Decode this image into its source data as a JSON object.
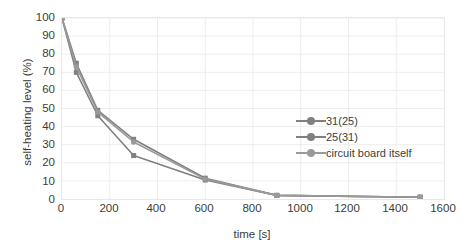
{
  "chart_data": {
    "type": "line",
    "title": "",
    "xlabel": "time [s]",
    "ylabel": "self-heating level (%)",
    "xlim": [
      0,
      1600
    ],
    "ylim": [
      0,
      100
    ],
    "xticks": [
      0,
      200,
      400,
      600,
      800,
      1000,
      1200,
      1400,
      1600
    ],
    "yticks": [
      0,
      10,
      20,
      30,
      40,
      50,
      60,
      70,
      80,
      90,
      100
    ],
    "grid": true,
    "legend_position": "inside-right",
    "series": [
      {
        "name": "31(25)",
        "color": "#808080",
        "x": [
          0,
          60,
          150,
          300,
          600,
          900,
          1500
        ],
        "y": [
          100,
          75,
          49,
          33,
          11.5,
          2,
          1
        ]
      },
      {
        "name": "25(31)",
        "color": "#808080",
        "x": [
          0,
          60,
          150,
          300,
          600,
          900,
          1500
        ],
        "y": [
          100,
          70,
          46,
          24,
          10.5,
          2,
          1
        ]
      },
      {
        "name": "circuit board itself",
        "color": "#9a9a9a",
        "x": [
          0,
          60,
          150,
          300,
          600,
          900,
          1500
        ],
        "y": [
          100,
          73,
          48,
          31.5,
          11,
          2,
          1
        ]
      }
    ]
  },
  "axes": {
    "y_tick_labels": [
      "100",
      "90",
      "80",
      "70",
      "60",
      "50",
      "40",
      "30",
      "20",
      "10",
      "0"
    ],
    "x_tick_labels": [
      "0",
      "200",
      "400",
      "600",
      "800",
      "1000",
      "1200",
      "1400",
      "1600"
    ],
    "x_axis_title": "time [s]",
    "y_axis_title": "self-heating level (%)"
  },
  "legend": {
    "items": [
      {
        "label": "31(25)",
        "color": "#808080"
      },
      {
        "label": "25(31)",
        "color": "#808080"
      },
      {
        "label": "circuit board itself",
        "color": "#9a9a9a"
      }
    ]
  },
  "colors": {
    "grid": "#ededed",
    "plot_border": "#e8e8e8",
    "text": "#3c3c3c",
    "series_dark": "#808080",
    "series_light": "#9a9a9a",
    "background": "#ffffff"
  }
}
